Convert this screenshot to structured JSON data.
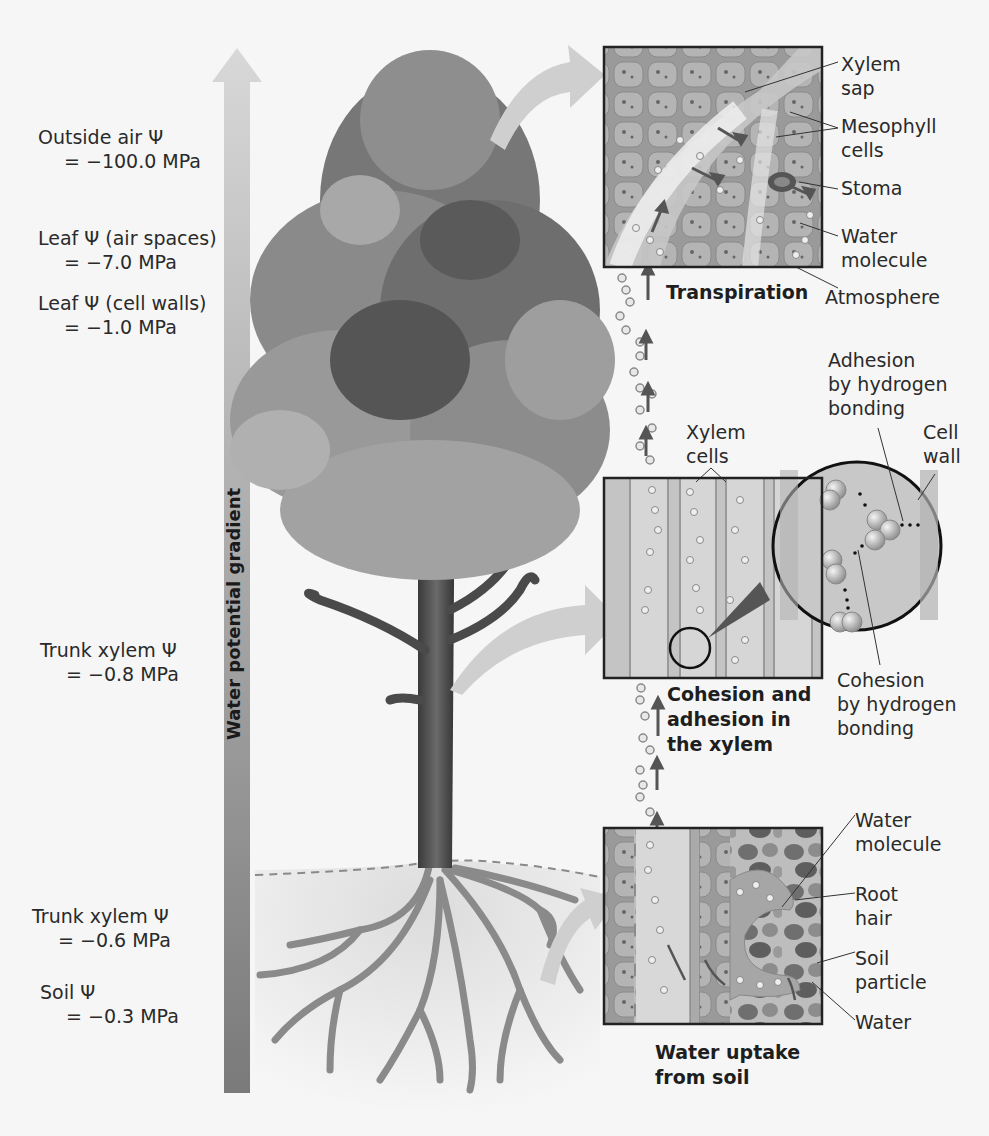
{
  "figure": {
    "gradient_axis_label": "Water potential gradient",
    "gradient_colors": {
      "top": "#d6d6d6",
      "bottom": "#7d7d7d"
    }
  },
  "water_potentials": [
    {
      "label": "Outside air Ψ",
      "value": "= −100.0 MPa"
    },
    {
      "label": "Leaf Ψ (air spaces)",
      "value": "= −7.0 MPa"
    },
    {
      "label": "Leaf Ψ (cell walls)",
      "value": "= −1.0 MPa"
    },
    {
      "label": "Trunk xylem Ψ",
      "value": "= −0.8 MPa"
    },
    {
      "label": "Trunk xylem Ψ",
      "value": "=  −0.6 MPa"
    },
    {
      "label": "Soil Ψ",
      "value": "= −0.3 MPa"
    }
  ],
  "panels": {
    "transpiration": {
      "title": "Transpiration",
      "callouts": [
        "Xylem",
        "sap",
        "Mesophyll",
        "cells",
        "Stoma",
        "Water",
        "molecule",
        "Atmosphere"
      ]
    },
    "cohesion": {
      "title_lines": [
        "Cohesion and",
        "adhesion in",
        "the xylem"
      ],
      "callouts": {
        "xylem_cells": [
          "Xylem",
          "cells"
        ],
        "adhesion": [
          "Adhesion",
          "by hydrogen",
          "bonding"
        ],
        "cell_wall": [
          "Cell",
          "wall"
        ],
        "cohesion": [
          "Cohesion",
          "by hydrogen",
          "bonding"
        ]
      }
    },
    "uptake": {
      "title_lines": [
        "Water uptake",
        "from soil"
      ],
      "callouts": {
        "water_molecule": [
          "Water",
          "molecule"
        ],
        "root_hair": [
          "Root",
          "hair"
        ],
        "soil_particle": [
          "Soil",
          "particle"
        ],
        "water": [
          "Water"
        ]
      }
    }
  }
}
